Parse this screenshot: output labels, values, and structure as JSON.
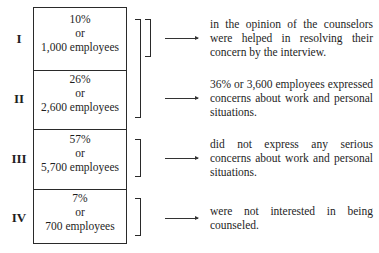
{
  "rows": [
    {
      "roman": "I",
      "percent": "10%",
      "connector": "or",
      "employees": "1,000 employees"
    },
    {
      "roman": "II",
      "percent": "26%",
      "connector": "or",
      "employees": "2,600 employees"
    },
    {
      "roman": "III",
      "percent": "57%",
      "connector": "or",
      "employees": "5,700 employees"
    },
    {
      "roman": "IV",
      "percent": "7%",
      "connector": "or",
      "employees": "700 employees"
    }
  ],
  "descriptions": [
    "in the opinion of the counselors were helped in resolving their concern by the interview.",
    "36% or 3,600 employees expressed concerns about work and personal situations.",
    "did not express any serious concerns about work and personal situations.",
    "were not interested in being counseled."
  ],
  "brackets": [
    {
      "group": "I",
      "spans": [
        "I"
      ]
    },
    {
      "group": "I+II",
      "spans": [
        "I",
        "II"
      ]
    },
    {
      "group": "III",
      "spans": [
        "III"
      ]
    },
    {
      "group": "IV",
      "spans": [
        "IV"
      ]
    }
  ],
  "colors": {
    "ink": "#1e1e1e",
    "background": "#ffffff"
  }
}
